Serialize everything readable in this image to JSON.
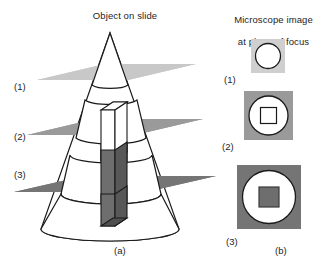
{
  "figure": {
    "type": "scientific-diagram",
    "panels": {
      "left": {
        "title": "Object on slide",
        "caption": "(a)",
        "plane_labels": [
          "(1)",
          "(2)",
          "(3)"
        ],
        "planes": [
          {
            "id": "(1)",
            "name": "focal-plane-1",
            "color": "#c8c8c8",
            "level": "top",
            "section": "small circle (cone tip)"
          },
          {
            "id": "(2)",
            "name": "focal-plane-2",
            "color": "#9a9a9a",
            "level": "middle",
            "section": "medium circle with square outline"
          },
          {
            "id": "(3)",
            "name": "focal-plane-3",
            "color": "#757575",
            "level": "bottom",
            "section": "large circle with filled square"
          }
        ],
        "objects": [
          {
            "name": "cone",
            "fill": "#ffffff",
            "stroke": "#1a1a1a"
          },
          {
            "name": "rod",
            "fill_above_plane3": "#ffffff",
            "fill_below_plane3": "#6e6e6e",
            "stroke": "#1a1a1a"
          }
        ]
      },
      "right": {
        "title_line1": "Microscope image",
        "title_line2": "at plane of focus",
        "caption": "(b)",
        "views": [
          {
            "id": "(1)",
            "name": "microscope-view-1",
            "background": "#cfcfcf",
            "circle": {
              "fill": "#ffffff",
              "stroke": "#1a1a1a",
              "diameter_px": 26
            },
            "inner": null,
            "size_px": 34
          },
          {
            "id": "(2)",
            "name": "microscope-view-2",
            "background": "#9a9a9a",
            "circle": {
              "fill": "#ffffff",
              "stroke": "#1a1a1a",
              "diameter_px": 40
            },
            "inner": {
              "shape": "square",
              "fill": "#ffffff",
              "stroke": "#1a1a1a",
              "size_px": 16
            },
            "size_px": 49
          },
          {
            "id": "(3)",
            "name": "microscope-view-3",
            "background": "#757575",
            "circle": {
              "fill": "#ffffff",
              "stroke": "#1a1a1a",
              "diameter_px": 54
            },
            "inner": {
              "shape": "square",
              "fill": "#6e6e6e",
              "stroke": "#3a3a3a",
              "size_px": 20
            },
            "size_px": 64
          }
        ]
      }
    },
    "colors": {
      "background": "#ffffff",
      "ink": "#1a1a1a",
      "plane_light": "#c8c8c8",
      "plane_medium": "#9a9a9a",
      "plane_dark": "#757575",
      "rod_shade": "#6e6e6e",
      "rod_side_shade": "#585858"
    }
  }
}
